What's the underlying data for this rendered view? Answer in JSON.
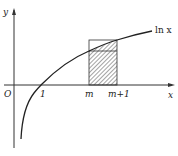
{
  "diagram": {
    "type": "function-graph",
    "curve_label": "ln x",
    "axes": {
      "y_label": "y",
      "x_label": "x",
      "origin_label": "O"
    },
    "ticks": [
      {
        "label": "1"
      },
      {
        "label": "m"
      },
      {
        "label": "m+1"
      }
    ],
    "shaded_region": "rectangle between m and m+1 under ln x (hatched)",
    "colors": {
      "line": "#222222",
      "background": "#ffffff"
    }
  }
}
